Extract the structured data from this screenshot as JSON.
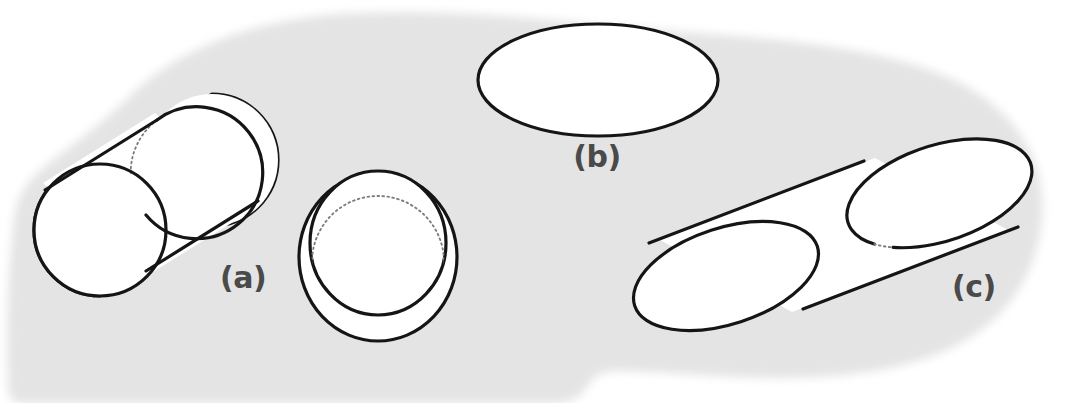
{
  "figure": {
    "background_color": "#ffffff",
    "blob_color": "#e4e4e4",
    "line_color": "#151515",
    "hidden_line_color": "#7d7d7d",
    "label_color": "#4a4a4a",
    "labels": [
      {
        "id": "a",
        "text": "(a)",
        "x": 220,
        "y": 288
      },
      {
        "id": "b",
        "text": "(b)",
        "x": 597,
        "y": 167
      },
      {
        "id": "c",
        "text": "(c)",
        "x": 952,
        "y": 297
      }
    ],
    "shapes": [
      {
        "id": "cylinder-a",
        "name": "oblique-cylinder-a",
        "kind": "cylinder",
        "label": "(a)",
        "front_face": {
          "cx": 100,
          "cy": 230,
          "rx": 66,
          "ry": 66,
          "rotation": 0
        },
        "back_face": {
          "cx": 212,
          "cy": 160,
          "rx": 66,
          "ry": 66,
          "rotation": 0
        },
        "hidden_arc": "lower-left"
      },
      {
        "id": "cylinder-middle",
        "name": "foreshortened-cylinder",
        "kind": "cylinder",
        "label": "",
        "front_face": {
          "cx": 378,
          "cy": 243,
          "rx": 68,
          "ry": 72,
          "rotation": 0
        },
        "back_face": {
          "cx": 378,
          "cy": 257,
          "rx": 79,
          "ry": 84,
          "rotation": 0
        },
        "hidden_arc": "upper"
      },
      {
        "id": "cylinder-b",
        "name": "end-on-cylinder-b",
        "kind": "ellipse",
        "label": "(b)",
        "front_face": {
          "cx": 598,
          "cy": 80,
          "rx": 120,
          "ry": 56,
          "rotation": 0
        },
        "back_face": null,
        "hidden_arc": "none"
      },
      {
        "id": "cylinder-c",
        "name": "oblique-cylinder-c",
        "kind": "cylinder",
        "label": "(c)",
        "front_face": {
          "cx": 726,
          "cy": 276,
          "rx": 96,
          "ry": 48,
          "rotation": -18
        },
        "back_face": {
          "cx": 941,
          "cy": 194,
          "rx": 96,
          "ry": 48,
          "rotation": -18
        },
        "hidden_arc": "lower-left"
      }
    ],
    "blob": {
      "name": "paper-background-blob",
      "notch": "bottom-center"
    }
  }
}
